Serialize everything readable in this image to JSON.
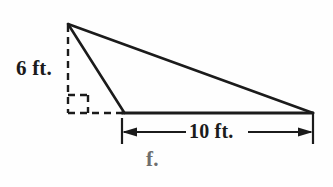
{
  "figure": {
    "kind": "geometry-diagram",
    "shape": "triangle",
    "part_label": "f.",
    "background_color": "#fefefe",
    "line_color": "#1b1b1b",
    "label_color": "#1b1b1b",
    "part_label_color": "#6e6e6e",
    "labels": {
      "height": "6 ft.",
      "base": "10 ft."
    },
    "measurements": [
      {
        "name": "height",
        "value": 6,
        "unit": "ft.",
        "text": "6 ft.",
        "orientation": "vertical",
        "style": "dashed"
      },
      {
        "name": "base",
        "value": 10,
        "unit": "ft.",
        "text": "10 ft.",
        "orientation": "horizontal",
        "style": "dimension-line-with-arrows"
      }
    ],
    "markers": {
      "right_angle": "right-angle-square"
    },
    "vertices": {
      "apex": [
        68,
        24
      ],
      "base_left": [
        124,
        113
      ],
      "base_right": [
        313,
        113
      ],
      "foot_of_height": [
        68,
        113
      ]
    }
  }
}
